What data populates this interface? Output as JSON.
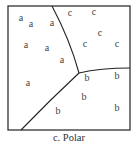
{
  "diagram": {
    "box": {
      "x": 8,
      "y": 6,
      "width": 122,
      "height": 124,
      "stroke": "#333333"
    },
    "boundaries": {
      "top": {
        "x1": 52,
        "y1": 6,
        "cx": 70,
        "cy": 40,
        "x2": 79,
        "y2": 73
      },
      "right": {
        "x1": 79,
        "y1": 73,
        "cx": 100,
        "cy": 68,
        "x2": 130,
        "y2": 68
      },
      "bottom": {
        "x1": 79,
        "y1": 73,
        "cx": 50,
        "cy": 100,
        "x2": 21,
        "y2": 130
      }
    },
    "regions": [
      "a",
      "b",
      "c"
    ],
    "points": [
      {
        "label": "a",
        "x": 21,
        "y": 21
      },
      {
        "label": "a",
        "x": 31,
        "y": 27
      },
      {
        "label": "a",
        "x": 52,
        "y": 26
      },
      {
        "label": "a",
        "x": 26,
        "y": 48
      },
      {
        "label": "a",
        "x": 47,
        "y": 51
      },
      {
        "label": "a",
        "x": 62,
        "y": 63
      },
      {
        "label": "a",
        "x": 28,
        "y": 86
      },
      {
        "label": "c",
        "x": 70,
        "y": 16
      },
      {
        "label": "c",
        "x": 94,
        "y": 15
      },
      {
        "label": "c",
        "x": 100,
        "y": 36
      },
      {
        "label": "c",
        "x": 85,
        "y": 47
      },
      {
        "label": "c",
        "x": 117,
        "y": 47
      },
      {
        "label": "b",
        "x": 87,
        "y": 81
      },
      {
        "label": "b",
        "x": 117,
        "y": 79
      },
      {
        "label": "b",
        "x": 84,
        "y": 100
      },
      {
        "label": "b",
        "x": 58,
        "y": 114
      },
      {
        "label": "b",
        "x": 117,
        "y": 111
      }
    ],
    "caption": "c. Polar"
  }
}
